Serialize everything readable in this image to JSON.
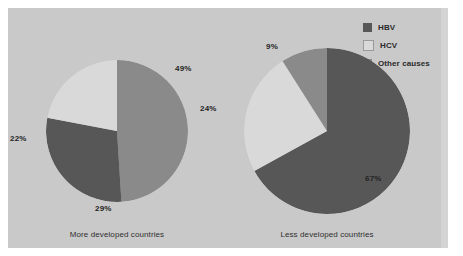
{
  "figure": {
    "background_color": "#c9c9c9",
    "legend": {
      "position": "top-right",
      "items": [
        {
          "label": "HBV",
          "color": "#575757",
          "swatch_name": "legend-swatch-hbv"
        },
        {
          "label": "HCV",
          "color": "#d9d9d9",
          "swatch_name": "legend-swatch-hcv"
        },
        {
          "label": "Other causes",
          "color": "#8a8a8a",
          "swatch_name": "legend-swatch-other-causes"
        }
      ]
    },
    "charts": [
      {
        "caption": "More developed countries",
        "labels": [
          "49%",
          "29%",
          "22%"
        ]
      },
      {
        "caption": "Less developed countries",
        "labels": [
          "67%",
          "24%",
          "9%"
        ]
      }
    ]
  },
  "chart_data": [
    {
      "type": "pie",
      "title": "More developed countries",
      "categories": [
        "Other causes",
        "HBV",
        "HCV"
      ],
      "values": [
        49,
        29,
        22
      ],
      "value_labels": [
        "49%",
        "29%",
        "22%"
      ],
      "colors": [
        "#8a8a8a",
        "#575757",
        "#d9d9d9"
      ],
      "units": "percent",
      "legend": "shared, top-right",
      "grid": false
    },
    {
      "type": "pie",
      "title": "Less developed countries",
      "categories": [
        "HBV",
        "HCV",
        "Other causes"
      ],
      "values": [
        67,
        24,
        9
      ],
      "value_labels": [
        "67%",
        "24%",
        "9%"
      ],
      "colors": [
        "#575757",
        "#d9d9d9",
        "#8a8a8a"
      ],
      "units": "percent",
      "legend": "shared, top-right",
      "grid": false
    }
  ]
}
